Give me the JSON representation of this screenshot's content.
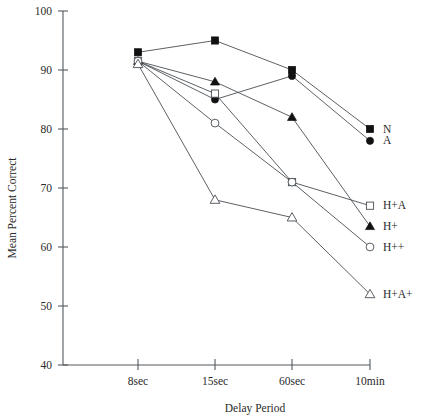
{
  "chart_data": {
    "type": "line",
    "title": "",
    "subtitle": "",
    "xlabel": "Delay Period",
    "ylabel": "Mean Percent Correct",
    "categories": [
      "8sec",
      "15sec",
      "60sec",
      "10min"
    ],
    "x_tick_labels": [
      "8sec",
      "15sec",
      "60sec",
      "10min"
    ],
    "y_tick_labels": [
      "40",
      "50",
      "60",
      "70",
      "80",
      "90",
      "100"
    ],
    "y_ticks": [
      40,
      50,
      60,
      70,
      80,
      90,
      100
    ],
    "ylim": [
      40,
      100
    ],
    "grid": false,
    "legend_position": "right-inline-at-last-point",
    "series": [
      {
        "name": "N",
        "marker": "filled-square",
        "values": [
          93,
          95,
          90,
          80
        ]
      },
      {
        "name": "A",
        "marker": "filled-circle",
        "values": [
          91.5,
          85,
          89,
          78
        ]
      },
      {
        "name": "H+A",
        "marker": "open-square",
        "values": [
          91.5,
          86,
          71,
          67
        ]
      },
      {
        "name": "H+",
        "marker": "filled-triangle",
        "values": [
          91.5,
          88,
          82,
          63.5
        ]
      },
      {
        "name": "H++",
        "marker": "open-circle",
        "values": [
          91.5,
          81,
          71,
          60
        ]
      },
      {
        "name": "H+A+",
        "marker": "open-triangle",
        "values": [
          91,
          68,
          65,
          52
        ]
      }
    ],
    "legend_entries": [
      {
        "label": "N",
        "marker": "filled-square"
      },
      {
        "label": "A",
        "marker": "filled-circle"
      },
      {
        "label": "H+A",
        "marker": "open-square"
      },
      {
        "label": "H+",
        "marker": "filled-triangle"
      },
      {
        "label": "H++",
        "marker": "open-circle"
      },
      {
        "label": "H+A+",
        "marker": "open-triangle"
      }
    ],
    "colors": {
      "axis": "#555a5e",
      "line": "#4a4f55",
      "marker_filled": "#111111",
      "marker_open_fill": "#ffffff",
      "text": "#2a2a2a",
      "background": "#ffffff"
    }
  },
  "axis": {
    "y_title": "Mean Percent Correct",
    "x_title": "Delay Period",
    "y_labels": [
      "100",
      "90",
      "80",
      "70",
      "60",
      "50",
      "40"
    ],
    "x_labels": [
      "8sec",
      "15sec",
      "60sec",
      "10min"
    ]
  },
  "legend": {
    "labels": [
      "N",
      "A",
      "H+A",
      "H+",
      "H++",
      "H+A+"
    ]
  }
}
